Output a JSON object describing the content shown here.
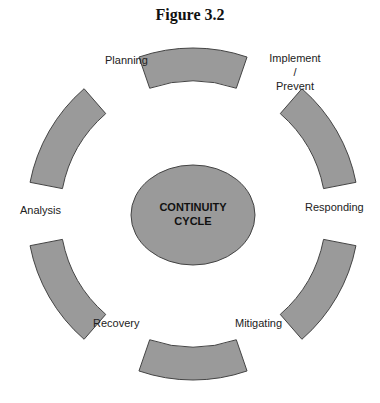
{
  "figure": {
    "title": "Figure 3.2"
  },
  "center": {
    "line1": "CONTINUITY",
    "line2": "CYCLE"
  },
  "stages": [
    {
      "label": "Planning"
    },
    {
      "label_line1": "Implement",
      "label_line2": "/",
      "label_line3": "Prevent"
    },
    {
      "label": "Responding"
    },
    {
      "label": "Mitigating"
    },
    {
      "label": "Recovery"
    },
    {
      "label": "Analysis"
    }
  ],
  "colors": {
    "segment_fill": "#9a9a9a",
    "segment_stroke": "#444444",
    "center_fill": "#9a9a9a"
  }
}
